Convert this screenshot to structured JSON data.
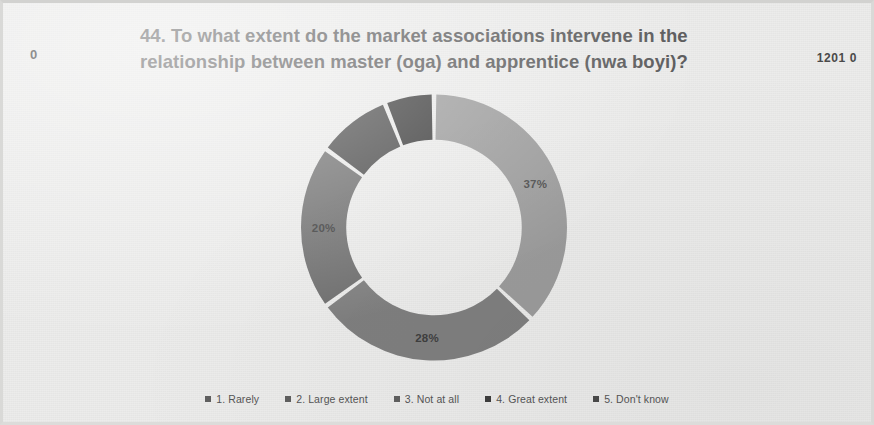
{
  "slide": {
    "corner_left": "0",
    "corner_right": "1201 0",
    "title_line1": "44. To what extent do the market associations intervene in the",
    "title_line2": "relationship between master (oga) and apprentice (nwa boyi)?"
  },
  "legend": {
    "items": [
      {
        "label": "1. Rarely",
        "color": "#5f5f5f"
      },
      {
        "label": "2. Large extent",
        "color": "#5f5f5f"
      },
      {
        "label": "3. Not at all",
        "color": "#5f5f5f"
      },
      {
        "label": "4. Great extent",
        "color": "#3d3d3d"
      },
      {
        "label": "5. Don't know",
        "color": "#4a4a4a"
      }
    ]
  },
  "chart_data": {
    "type": "pie",
    "variant": "donut",
    "title": "44. To what extent do the market associations intervene in the relationship between master (oga) and apprentice (nwa boyi)?",
    "categories": [
      "1. Rarely",
      "2. Large extent",
      "3. Not at all",
      "4. Great extent",
      "5. Don't know"
    ],
    "values": [
      37,
      28,
      20,
      9,
      6
    ],
    "labels": [
      "37%",
      "28%",
      "20%",
      "",
      ""
    ],
    "colors": [
      "#9a9a9a",
      "#7e7e7e",
      "#6e6e6e",
      "#4a4a4a",
      "#3a3a3a"
    ],
    "label_colors": [
      "#4a4a4a",
      "#3f3f3f",
      "#3a3a3a",
      "#d6d6d6",
      "#d6d6d6"
    ],
    "legend_position": "bottom",
    "grid": false,
    "start_angle": 0,
    "gap_degrees": 2,
    "inner_radius_ratio": 0.66
  }
}
